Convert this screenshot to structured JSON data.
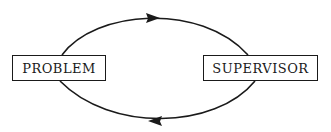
{
  "diagram": {
    "nodes": [
      {
        "id": "problem",
        "label": "PROBLEM"
      },
      {
        "id": "supervisor",
        "label": "SUPERVISOR"
      }
    ],
    "edges": [
      {
        "from": "problem",
        "to": "supervisor",
        "position": "top",
        "arrow_direction": "right"
      },
      {
        "from": "supervisor",
        "to": "problem",
        "position": "bottom",
        "arrow_direction": "left"
      }
    ],
    "colors": {
      "stroke": "#1a1a1a",
      "background": "#ffffff"
    }
  }
}
